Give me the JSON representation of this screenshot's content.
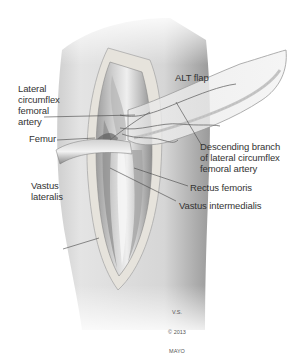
{
  "figure": {
    "type": "anatomical-illustration",
    "colors": {
      "background": "#ffffff",
      "skin": "#d9d9d9",
      "incision_edge": "#e9e6e0",
      "muscle": "#c6c6c6",
      "vessel": "#6a6a6a",
      "label_text": "#333333",
      "leader_line": "#444444"
    }
  },
  "labels": {
    "alt_flap": "ALT flap",
    "lateral_circumflex_femoral_artery": "Lateral\ncircumflex\nfemoral\nartery",
    "femur": "Femur",
    "descending_branch": "Descending branch\nof lateral circumflex\nfemoral artery",
    "vastus_lateralis": "Vastus\nlateralis",
    "rectus_femoris": "Rectus femoris",
    "vastus_intermedialis": "Vastus intermedialis"
  },
  "credit": {
    "initials": "V.S.",
    "copyright": "© 2013",
    "org": "MAYO"
  }
}
